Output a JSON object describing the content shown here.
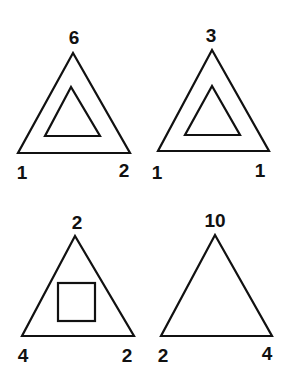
{
  "puzzle": {
    "panels": [
      {
        "top": "6",
        "left": "1",
        "right": "2",
        "inner": "triangle"
      },
      {
        "top": "3",
        "left": "1",
        "right": "1",
        "inner": "triangle"
      },
      {
        "top": "2",
        "left": "4",
        "right": "2",
        "inner": "square"
      },
      {
        "top": "10",
        "left": "2",
        "right": "4",
        "inner": "none"
      }
    ]
  },
  "colors": {
    "stroke": "#111111",
    "background": "#ffffff"
  }
}
